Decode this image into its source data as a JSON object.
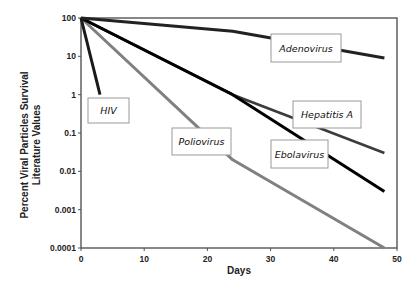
{
  "chart_data": {
    "type": "line",
    "title": "",
    "xlabel": "Days",
    "ylabel": [
      "Percent Viral Particles Survival",
      "Literature Values"
    ],
    "xlim": [
      0,
      50
    ],
    "ylim": [
      0.0001,
      100
    ],
    "yscale": "log",
    "grid": false,
    "legend_position": "inline-labels",
    "x_ticks": [
      0,
      10,
      20,
      30,
      40,
      50
    ],
    "y_ticks": [
      100,
      10,
      1,
      0.1,
      0.01,
      0.001,
      0.0001
    ],
    "x_tick_labels": [
      "0",
      "10",
      "20",
      "30",
      "40",
      "50"
    ],
    "y_tick_labels": [
      "100",
      "10",
      "1",
      "0.1",
      "0.01",
      "0.001",
      "0.0001"
    ],
    "series": [
      {
        "name": "HIV",
        "color": "#1a1a1a",
        "width": 3,
        "points": [
          [
            0,
            100
          ],
          [
            3,
            1
          ]
        ],
        "label_box": {
          "x": 88,
          "y": 98,
          "w": 41,
          "h": 25
        }
      },
      {
        "name": "Adenovirus",
        "color": "#222222",
        "width": 3,
        "points": [
          [
            0,
            100
          ],
          [
            24,
            45
          ],
          [
            48,
            9
          ]
        ],
        "label_box": {
          "x": 271,
          "y": 34,
          "w": 70,
          "h": 28
        }
      },
      {
        "name": "Hepatitis A",
        "color": "#3c3c3c",
        "width": 2.6,
        "points": [
          [
            0,
            100
          ],
          [
            24,
            1
          ],
          [
            48,
            0.03
          ]
        ],
        "label_box": {
          "x": 293,
          "y": 101,
          "w": 68,
          "h": 27
        }
      },
      {
        "name": "Ebolavirus",
        "color": "#000000",
        "width": 3,
        "points": [
          [
            0,
            100
          ],
          [
            24,
            1
          ],
          [
            48,
            0.003
          ]
        ],
        "label_box": {
          "x": 271,
          "y": 140,
          "w": 57,
          "h": 28
        }
      },
      {
        "name": "Poliovirus",
        "color": "#808080",
        "width": 3,
        "points": [
          [
            0,
            100
          ],
          [
            24,
            0.02
          ],
          [
            48,
            0.0001
          ]
        ],
        "label_box": {
          "x": 172,
          "y": 128,
          "w": 59,
          "h": 27
        }
      }
    ]
  },
  "plot_area": {
    "left": 81,
    "top": 18,
    "right": 397,
    "bottom": 248
  }
}
